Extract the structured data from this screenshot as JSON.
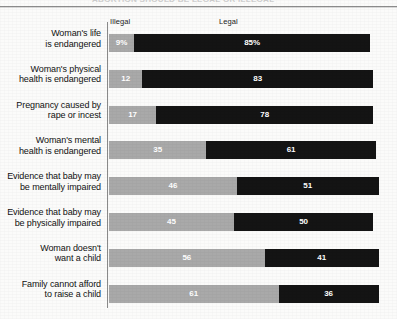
{
  "page": {
    "bleed_text": "ABORTION SHOULD BE LEGAL OR ILLEGAL"
  },
  "chart_data": {
    "type": "bar",
    "orientation": "horizontal",
    "stacked": true,
    "title": "",
    "xlabel": "",
    "ylabel": "",
    "grid": false,
    "legend_position": "top",
    "xlim": [
      0,
      100
    ],
    "categories": [
      "Woman's life is endangered",
      "Woman's physical health is endangered",
      "Pregnancy caused by rape or incest",
      "Woman's mental health is endangered",
      "Evidence that baby may be mentally impaired",
      "Evidence that baby may be physically impaired",
      "Woman doesn't want a child",
      "Family cannot afford to raise a child"
    ],
    "series": [
      {
        "name": "Illegal",
        "color": "#a9a9a9",
        "values": [
          9,
          12,
          17,
          35,
          46,
          45,
          56,
          61
        ],
        "labels": [
          "9%",
          "12",
          "17",
          "35",
          "46",
          "45",
          "56",
          "61"
        ]
      },
      {
        "name": "Legal",
        "color": "#141414",
        "values": [
          85,
          83,
          78,
          61,
          51,
          50,
          41,
          36
        ],
        "labels": [
          "85%",
          "83",
          "78",
          "61",
          "51",
          "50",
          "41",
          "36"
        ]
      }
    ]
  },
  "rows": [
    {
      "label_line1": "Woman's life",
      "label_line2": "is endangered",
      "illegal": 9,
      "legal": 85,
      "illegal_label": "9%",
      "legal_label": "85%"
    },
    {
      "label_line1": "Woman's physical",
      "label_line2": "health is endangered",
      "illegal": 12,
      "legal": 83,
      "illegal_label": "12",
      "legal_label": "83"
    },
    {
      "label_line1": "Pregnancy caused by",
      "label_line2": "rape or incest",
      "illegal": 17,
      "legal": 78,
      "illegal_label": "17",
      "legal_label": "78"
    },
    {
      "label_line1": "Woman's mental",
      "label_line2": "health is endangered",
      "illegal": 35,
      "legal": 61,
      "illegal_label": "35",
      "legal_label": "61"
    },
    {
      "label_line1": "Evidence that baby may",
      "label_line2": "be mentally impaired",
      "illegal": 46,
      "legal": 51,
      "illegal_label": "46",
      "legal_label": "51"
    },
    {
      "label_line1": "Evidence that baby may",
      "label_line2": "be physically impaired",
      "illegal": 45,
      "legal": 50,
      "illegal_label": "45",
      "legal_label": "50"
    },
    {
      "label_line1": "Woman doesn't",
      "label_line2": "want a child",
      "illegal": 56,
      "legal": 41,
      "illegal_label": "56",
      "legal_label": "41"
    },
    {
      "label_line1": "Family cannot afford",
      "label_line2": "to raise a child",
      "illegal": 61,
      "legal": 36,
      "illegal_label": "61",
      "legal_label": "36"
    }
  ],
  "headers": {
    "illegal": "Illegal",
    "legal": "Legal"
  },
  "colors": {
    "illegal": "#a9a9a9",
    "legal": "#141414",
    "background": "#fbfbfa",
    "axis": "#8a8a8a"
  }
}
